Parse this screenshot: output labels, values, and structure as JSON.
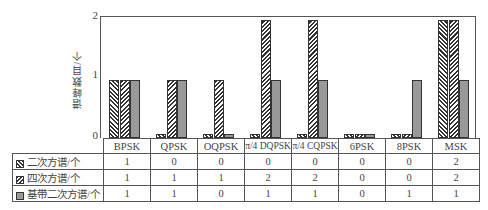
{
  "chart_data": {
    "type": "bar",
    "title": "",
    "xlabel": "",
    "ylabel": "谱峰数目/个",
    "ylim": [
      0,
      2
    ],
    "yticks": [
      "0",
      "1",
      "2"
    ],
    "grid": false,
    "legend_position": "table-left",
    "categories": [
      "BPSK",
      "QPSK",
      "OQPSK",
      "π/4 DQPSK",
      "π/4 CQPSK",
      "6PSK",
      "8PSK",
      "MSK"
    ],
    "series": [
      {
        "name": "二次方谱/个",
        "pattern": "hatch-forward",
        "values": [
          1,
          0,
          0,
          0,
          0,
          0,
          0,
          2
        ]
      },
      {
        "name": "四次方谱/个",
        "pattern": "hatch-back",
        "values": [
          1,
          1,
          1,
          2,
          2,
          0,
          0,
          2
        ]
      },
      {
        "name": "基带二次方谱/个",
        "pattern": "solid-gray",
        "values": [
          1,
          1,
          0,
          1,
          1,
          0,
          1,
          1
        ]
      }
    ]
  }
}
